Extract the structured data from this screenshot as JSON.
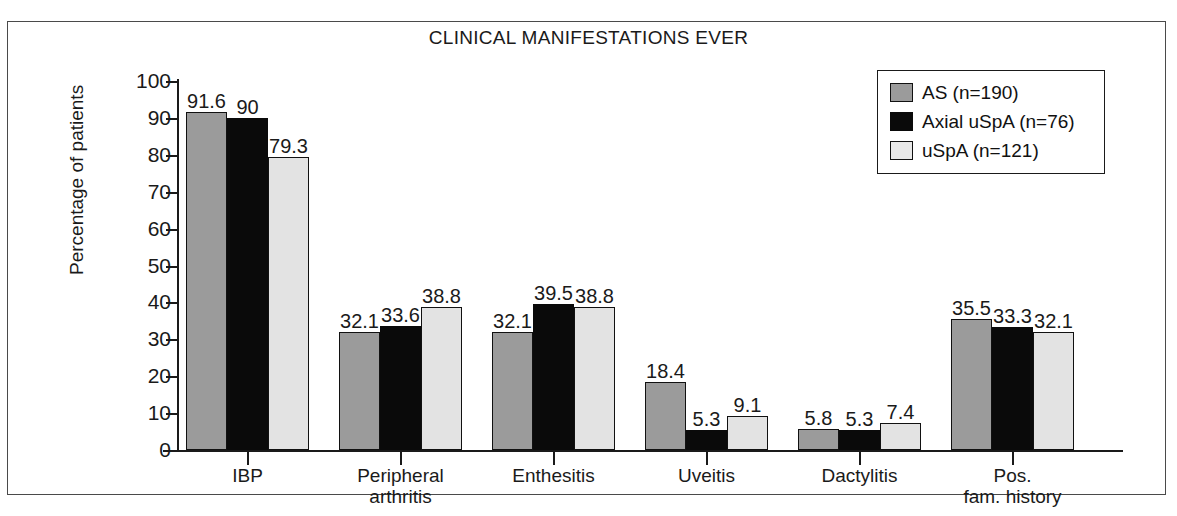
{
  "chart_data": {
    "type": "bar",
    "title": "CLINICAL MANIFESTATIONS EVER",
    "xlabel": "",
    "ylabel": "Percentage of patients",
    "ylim": [
      0,
      100
    ],
    "ytick_step": 10,
    "yticks": [
      100,
      90,
      80,
      70,
      60,
      50,
      40,
      30,
      20,
      10,
      0
    ],
    "grid": false,
    "legend_position": "top-right",
    "categories": [
      "IBP",
      "Peripheral\narthritis",
      "Enthesitis",
      "Uveitis",
      "Dactylitis",
      "Pos.\nfam. history"
    ],
    "category_labels": [
      [
        "IBP"
      ],
      [
        "Peripheral",
        "arthritis"
      ],
      [
        "Enthesitis"
      ],
      [
        "Uveitis"
      ],
      [
        "Dactylitis"
      ],
      [
        "Pos.",
        "fam. history"
      ]
    ],
    "series": [
      {
        "name": "AS (n=190)",
        "color": "#9b9b9b",
        "values": [
          91.6,
          32.1,
          32.1,
          18.4,
          5.8,
          35.5
        ],
        "labels": [
          "91.6",
          "32.1",
          "32.1",
          "18.4",
          "5.8",
          "35.5"
        ]
      },
      {
        "name": "Axial uSpA (n=76)",
        "color": "#0a0a0a",
        "values": [
          90,
          33.6,
          39.5,
          5.3,
          5.3,
          33.3
        ],
        "labels": [
          "90",
          "33.6",
          "39.5",
          "5.3",
          "5.3",
          "33.3"
        ]
      },
      {
        "name": "uSpA (n=121)",
        "color": "#e3e3e3",
        "values": [
          79.3,
          38.8,
          38.8,
          9.1,
          7.4,
          32.1
        ],
        "labels": [
          "79.3",
          "38.8",
          "38.8",
          "9.1",
          "7.4",
          "32.1"
        ]
      }
    ]
  },
  "legend": {
    "items": [
      {
        "label": "AS (n=190)",
        "swatch": "series0"
      },
      {
        "label": "Axial uSpA (n=76)",
        "swatch": "series1"
      },
      {
        "label": "uSpA (n=121)",
        "swatch": "series2"
      }
    ]
  },
  "colors": {
    "series0": "#9b9b9b",
    "series1": "#0a0a0a",
    "series2": "#e3e3e3",
    "axis": "#1a1a1a",
    "frame": "#4a4a4a",
    "background": "#ffffff"
  }
}
